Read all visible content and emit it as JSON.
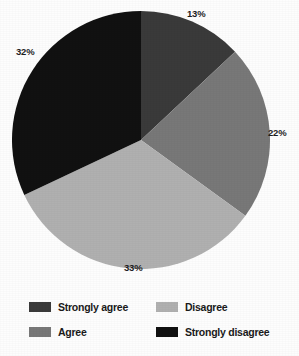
{
  "chart_data": {
    "type": "pie",
    "title": "",
    "subtitle": "",
    "xlabel": "",
    "ylabel": "",
    "legend_position": "bottom",
    "grid": false,
    "start_angle_deg": 0,
    "direction": "clockwise",
    "categories": [
      "Strongly agree",
      "Agree",
      "Disagree",
      "Strongly disagree"
    ],
    "values": [
      13,
      22,
      33,
      32
    ],
    "value_unit": "%",
    "colors": [
      "#3a3a3a",
      "#787878",
      "#b0b0b0",
      "#111111"
    ],
    "slices": [
      {
        "label": "Strongly agree",
        "value": 13,
        "display": "13%",
        "color": "#3a3a3a",
        "label_x": 187,
        "label_y": 9
      },
      {
        "label": "Agree",
        "value": 22,
        "display": "22%",
        "color": "#787878",
        "label_x": 268,
        "label_y": 128
      },
      {
        "label": "Disagree",
        "value": 33,
        "display": "33%",
        "color": "#b0b0b0",
        "label_x": 124,
        "label_y": 263
      },
      {
        "label": "Strongly disagree",
        "value": 32,
        "display": "32%",
        "color": "#111111",
        "label_x": 16,
        "label_y": 47
      }
    ],
    "geometry": {
      "center_x": 141,
      "center_y": 140,
      "radius": 129
    }
  },
  "legend": {
    "items": [
      {
        "label": "Strongly agree",
        "color": "#3a3a3a"
      },
      {
        "label": "Disagree",
        "color": "#b0b0b0"
      },
      {
        "label": "Agree",
        "color": "#787878"
      },
      {
        "label": "Strongly disagree",
        "color": "#111111"
      }
    ]
  }
}
